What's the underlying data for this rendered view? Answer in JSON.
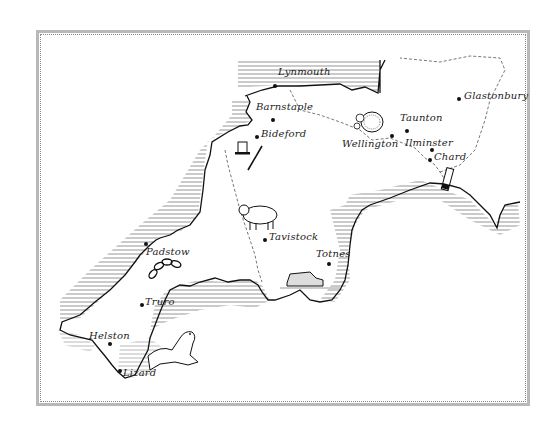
{
  "map": {
    "title": "Hand-drawn map of South West England",
    "colors": {
      "ink": "#111111",
      "paper": "#ffffff",
      "frame": "#b8b8b8",
      "hatch": "#444444"
    },
    "towns": [
      {
        "name": "Lynmouth",
        "dot": [
          275,
          86
        ],
        "label": [
          278,
          72
        ]
      },
      {
        "name": "Barnstaple",
        "dot": [
          273,
          120
        ],
        "label": [
          258,
          104
        ]
      },
      {
        "name": "Bideford",
        "dot": [
          257,
          137
        ],
        "label": [
          262,
          132
        ]
      },
      {
        "name": "Wellington",
        "dot": [
          392,
          136
        ],
        "label": [
          346,
          137
        ]
      },
      {
        "name": "Taunton",
        "dot": [
          407,
          131
        ],
        "label": [
          400,
          115
        ]
      },
      {
        "name": "Ilminster",
        "dot": [
          432,
          150
        ],
        "label": [
          405,
          140
        ]
      },
      {
        "name": "Chard",
        "dot": [
          430,
          160
        ],
        "label": [
          434,
          155
        ]
      },
      {
        "name": "Glastonbury",
        "dot": [
          459,
          99
        ],
        "label": [
          464,
          93
        ]
      },
      {
        "name": "Tavistock",
        "dot": [
          265,
          240
        ],
        "label": [
          270,
          234
        ]
      },
      {
        "name": "Totnes",
        "dot": [
          329,
          264
        ],
        "label": [
          316,
          251
        ]
      },
      {
        "name": "Padstow",
        "dot": [
          146,
          244
        ],
        "label": [
          146,
          250
        ]
      },
      {
        "name": "Truro",
        "dot": [
          142,
          305
        ],
        "label": [
          146,
          299
        ]
      },
      {
        "name": "Helston",
        "dot": [
          110,
          344
        ],
        "label": [
          89,
          333
        ]
      },
      {
        "name": "Lizard",
        "dot": [
          120,
          371
        ],
        "label": [
          123,
          369
        ]
      }
    ],
    "illustrations": [
      {
        "name": "top-hat-and-pen",
        "near": "Bideford"
      },
      {
        "name": "cider-apples",
        "near": "Wellington"
      },
      {
        "name": "sheep",
        "near": "Tavistock"
      },
      {
        "name": "vintage-car",
        "near": "Totnes"
      },
      {
        "name": "chain",
        "near": "Padstow"
      },
      {
        "name": "seal",
        "near": "Lizard"
      },
      {
        "name": "cannon",
        "near": "Chard"
      }
    ]
  }
}
